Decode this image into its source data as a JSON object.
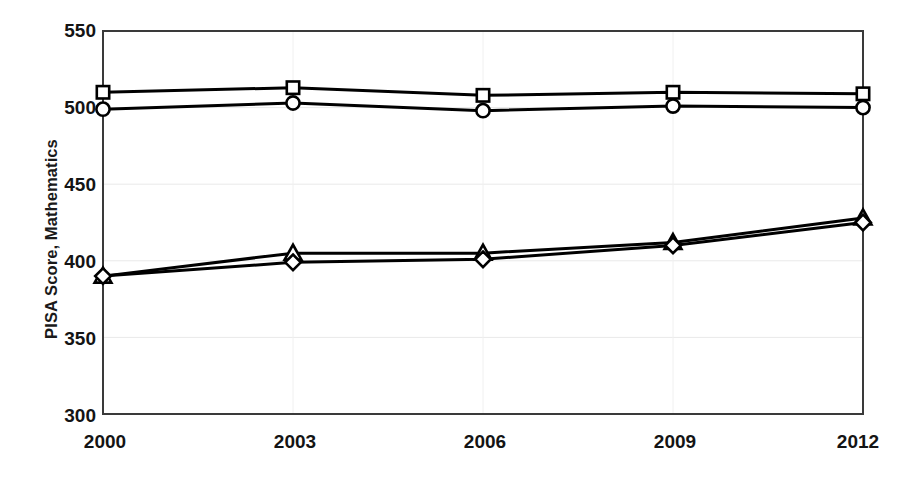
{
  "chart_data": {
    "type": "line",
    "title": "",
    "xlabel": "",
    "ylabel": "PISA Score, Mathematics",
    "categories": [
      "2000",
      "2003",
      "2006",
      "2009",
      "2012"
    ],
    "x": [
      2000,
      2003,
      2006,
      2009,
      2012
    ],
    "xlim": [
      2000,
      2012
    ],
    "ylim": [
      300,
      550
    ],
    "y_ticks": [
      300,
      350,
      400,
      450,
      500,
      550
    ],
    "x_ticks": [
      2000,
      2003,
      2006,
      2009,
      2012
    ],
    "grid": "horizontal-light",
    "legend": "none",
    "line_color": "#000000",
    "marker_fill": "#ffffff",
    "series": [
      {
        "name": "series-square",
        "marker": "square",
        "values": [
          510,
          513,
          508,
          510,
          509
        ]
      },
      {
        "name": "series-circle",
        "marker": "circle",
        "values": [
          499,
          503,
          498,
          501,
          500
        ]
      },
      {
        "name": "series-triangle",
        "marker": "triangle",
        "values": [
          390,
          405,
          405,
          412,
          428
        ]
      },
      {
        "name": "series-diamond",
        "marker": "diamond",
        "values": [
          390,
          399,
          401,
          410,
          425
        ]
      }
    ]
  },
  "axes": {
    "y_tick_labels": [
      "550",
      "500",
      "450",
      "400",
      "350",
      "300"
    ],
    "x_tick_labels": [
      "2000",
      "2003",
      "2006",
      "2009",
      "2012"
    ],
    "y_axis_title": "PISA Score, Mathematics"
  }
}
